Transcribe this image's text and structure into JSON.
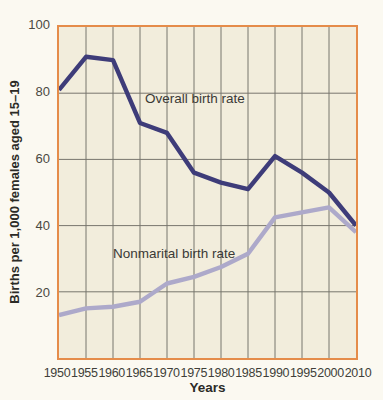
{
  "chart_data": {
    "type": "line",
    "title": "",
    "xlabel": "Years",
    "ylabel": "Births per 1,000 females aged 15–19",
    "x": [
      1950,
      1955,
      1960,
      1965,
      1970,
      1975,
      1980,
      1985,
      1990,
      1995,
      2000,
      2010
    ],
    "x_tick_labels": [
      "1950",
      "1955",
      "1960",
      "1965",
      "1970",
      "1975",
      "1980",
      "1985",
      "1990",
      "1995",
      "2000",
      "2010"
    ],
    "yticks": [
      20,
      40,
      60,
      80,
      100
    ],
    "ylim": [
      0,
      100
    ],
    "grid": true,
    "legend_position": "labels-inside-plot",
    "series": [
      {
        "name": "Overall birth rate",
        "color": "#3e3c79",
        "values": [
          81,
          91,
          90,
          71,
          68,
          56,
          53,
          51,
          61,
          56,
          50,
          40
        ]
      },
      {
        "name": "Nonmarital birth rate",
        "color": "#ada9ca",
        "values": [
          13,
          15,
          15.5,
          17,
          22.5,
          24.5,
          27.5,
          31.5,
          42.5,
          44,
          45.5,
          38
        ]
      }
    ],
    "colors": {
      "plot_background": "#f2eddc",
      "page_background": "#fbf9f1",
      "plot_border": "#e58c4a",
      "gridline": "#76746c",
      "tick_text": "#4a4942",
      "axis_title_text": "#2b2b26"
    }
  }
}
